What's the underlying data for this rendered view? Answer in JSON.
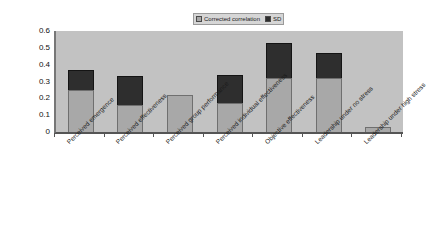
{
  "chart_data": {
    "type": "bar",
    "subtype": "stacked",
    "title": "",
    "xlabel": "",
    "ylabel": "",
    "ylim": [
      0,
      0.6
    ],
    "ytick_labels": [
      "0.6",
      "0.5",
      "0.4",
      "0.3",
      "0.2",
      "0.1",
      "0"
    ],
    "ytick_values": [
      0.6,
      0.5,
      0.4,
      0.3,
      0.2,
      0.1,
      0
    ],
    "grid": false,
    "legend_position": "top-center",
    "categories": [
      "Perceived emergence",
      "Perceived effectiveness",
      "Perceived group performance",
      "Perceived individual effectiveness",
      "Objective effectiveness",
      "Leadership under no stress",
      "Leadership under high stress"
    ],
    "series": [
      {
        "name": "Corrected correlation",
        "color": "#a8a8a8",
        "values": [
          0.25,
          0.16,
          0.22,
          0.17,
          0.32,
          0.32,
          0.03
        ]
      },
      {
        "name": "SD",
        "color": "#2e2e2e",
        "values": [
          0.12,
          0.17,
          0.0,
          0.17,
          0.21,
          0.15,
          0.0
        ]
      }
    ],
    "totals": [
      0.37,
      0.33,
      0.22,
      0.34,
      0.53,
      0.47,
      0.03
    ]
  },
  "legend": {
    "entries": [
      {
        "label": "Corrected correlation",
        "swatch": "corr"
      },
      {
        "label": "SD",
        "swatch": "sd"
      }
    ]
  },
  "colors": {
    "plot_background": "#c2c2c2",
    "page_background": "#ffffff",
    "corrected_correlation": "#a8a8a8",
    "sd": "#2e2e2e",
    "axis": "#555555",
    "legend_background": "#d6d6d6"
  }
}
